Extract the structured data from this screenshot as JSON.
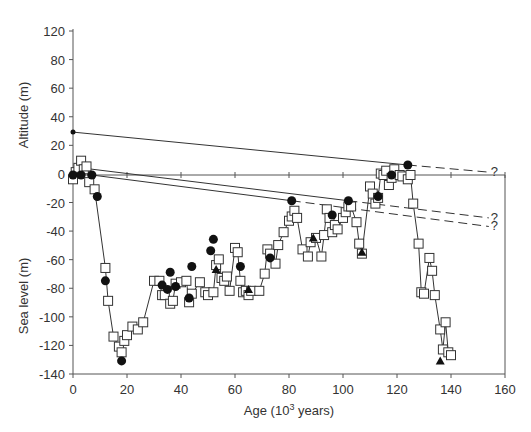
{
  "chart_data": {
    "type": "scatter",
    "title": "",
    "xlabel": "Age (10³ years)",
    "xlabel_base": "Age (10",
    "xlabel_sup": "3",
    "xlabel_tail": " years)",
    "ylabel_upper": "Altitude (m)",
    "ylabel_lower": "Sea level (m)",
    "xlim": [
      0,
      160
    ],
    "ylim": [
      -140,
      120
    ],
    "grid": false,
    "x_ticks": [
      0,
      20,
      40,
      60,
      80,
      100,
      120,
      140,
      160
    ],
    "y_ticks_upper": [
      {
        "value": 120,
        "label": "120"
      },
      {
        "value": 100,
        "label": "80"
      },
      {
        "value": 80,
        "label": "60"
      },
      {
        "value": 60,
        "label": "40"
      },
      {
        "value": 40,
        "label": "20"
      }
    ],
    "y_ticks_upper_note": "Upper axis labels printed as shown: 120, 80, 60, 40, 20, 0 at equal spacing",
    "y_ticks": [
      {
        "y": 120,
        "label": "120"
      },
      {
        "y": 100,
        "label": "80"
      },
      {
        "y": 80,
        "label": "60"
      },
      {
        "y": 60,
        "label": "40"
      },
      {
        "y": 40,
        "label": "20"
      },
      {
        "y": 20,
        "label": "0"
      },
      {
        "y": 0,
        "label": "-20"
      },
      {
        "y": -20,
        "label": "-40"
      },
      {
        "y": -40,
        "label": "-60"
      },
      {
        "y": -60,
        "label": "-80"
      },
      {
        "y": -80,
        "label": "-100"
      },
      {
        "y": -100,
        "label": "-120"
      },
      {
        "y": -120,
        "label": "-140"
      }
    ],
    "series": [
      {
        "name": "Sea-level curve (squares)",
        "marker": "open-square",
        "connected": true,
        "points": [
          [
            0,
            -3
          ],
          [
            1,
            2
          ],
          [
            2,
            5
          ],
          [
            3,
            10
          ],
          [
            4,
            4
          ],
          [
            5,
            6
          ],
          [
            6,
            -5
          ],
          [
            8,
            -10
          ],
          [
            12,
            -65
          ],
          [
            13,
            -88
          ],
          [
            15,
            -113
          ],
          [
            17,
            -120
          ],
          [
            18,
            -124
          ],
          [
            19,
            -116
          ],
          [
            20,
            -112
          ],
          [
            22,
            -106
          ],
          [
            24,
            -108
          ],
          [
            26,
            -103
          ],
          [
            30,
            -74
          ],
          [
            32,
            -74
          ],
          [
            33,
            -84
          ],
          [
            34,
            -84
          ],
          [
            36,
            -90
          ],
          [
            37,
            -88
          ],
          [
            38,
            -76
          ],
          [
            40,
            -75
          ],
          [
            42,
            -74
          ],
          [
            43,
            -89
          ],
          [
            44,
            -83
          ],
          [
            47,
            -75
          ],
          [
            49,
            -82
          ],
          [
            50,
            -84
          ],
          [
            52,
            -82
          ],
          [
            53,
            -63
          ],
          [
            54,
            -59
          ],
          [
            55,
            -72
          ],
          [
            56,
            -74
          ],
          [
            57,
            -71
          ],
          [
            58,
            -81
          ],
          [
            60,
            -51
          ],
          [
            61,
            -54
          ],
          [
            62,
            -74
          ],
          [
            63,
            -82
          ],
          [
            64,
            -81
          ],
          [
            65,
            -84
          ],
          [
            66,
            -81
          ],
          [
            69,
            -81
          ],
          [
            71,
            -69
          ],
          [
            72,
            -52
          ],
          [
            73,
            -55
          ],
          [
            75,
            -62
          ],
          [
            76,
            -49
          ],
          [
            78,
            -40
          ],
          [
            80,
            -32
          ],
          [
            81,
            -29
          ],
          [
            82,
            -25
          ],
          [
            83,
            -30
          ],
          [
            85,
            -52
          ],
          [
            87,
            -57
          ],
          [
            88,
            -47
          ],
          [
            90,
            -44
          ],
          [
            92,
            -57
          ],
          [
            93,
            -42
          ],
          [
            94,
            -24
          ],
          [
            95,
            -30
          ],
          [
            96,
            -40
          ],
          [
            97,
            -35
          ],
          [
            98,
            -38
          ],
          [
            100,
            -30
          ],
          [
            101,
            -26
          ],
          [
            102,
            -22
          ],
          [
            103,
            -22
          ],
          [
            105,
            -33
          ],
          [
            106,
            -48
          ],
          [
            107,
            -55
          ],
          [
            110,
            -8
          ],
          [
            111,
            -13
          ],
          [
            112,
            -20
          ],
          [
            113,
            -16
          ],
          [
            114,
            1
          ],
          [
            115,
            0
          ],
          [
            116,
            3
          ],
          [
            117,
            -7
          ],
          [
            118,
            -2
          ],
          [
            119,
            4
          ],
          [
            121,
            0
          ],
          [
            122,
            -1
          ],
          [
            124,
            -3
          ],
          [
            125,
            0
          ],
          [
            126,
            -20
          ],
          [
            128,
            -48
          ],
          [
            129,
            -82
          ],
          [
            130,
            -83
          ],
          [
            132,
            -58
          ],
          [
            133,
            -67
          ],
          [
            134,
            -84
          ],
          [
            136,
            -108
          ],
          [
            137,
            -122
          ],
          [
            138,
            -103
          ],
          [
            139,
            -124
          ],
          [
            140,
            -126
          ]
        ]
      },
      {
        "name": "Filled circles",
        "marker": "filled-circle",
        "connected": false,
        "points": [
          [
            0,
            0
          ],
          [
            3,
            0
          ],
          [
            7,
            0
          ],
          [
            9,
            -15
          ],
          [
            12,
            -74
          ],
          [
            18,
            -130
          ],
          [
            33,
            -77
          ],
          [
            35,
            -80
          ],
          [
            36,
            -68
          ],
          [
            38,
            -78
          ],
          [
            43,
            -86
          ],
          [
            44,
            -64
          ],
          [
            51,
            -53
          ],
          [
            52,
            -45
          ],
          [
            62,
            -64
          ],
          [
            73,
            -58
          ],
          [
            81,
            -18
          ],
          [
            96,
            -28
          ],
          [
            102,
            -18
          ],
          [
            113,
            -15
          ],
          [
            118,
            0
          ],
          [
            124,
            7
          ]
        ]
      },
      {
        "name": "Filled triangles",
        "marker": "filled-triangle",
        "connected": false,
        "points": [
          [
            53,
            -66
          ],
          [
            65,
            -80
          ],
          [
            89,
            -44
          ],
          [
            107,
            -54
          ],
          [
            113,
            -14
          ],
          [
            136,
            -130
          ]
        ]
      },
      {
        "name": "Small dot",
        "marker": "small-dot",
        "connected": false,
        "points": [
          [
            0,
            30
          ]
        ]
      }
    ],
    "correlation_lines": [
      {
        "from": [
          0,
          30
        ],
        "to": [
          124,
          7
        ],
        "style": "solid"
      },
      {
        "from": [
          124,
          7
        ],
        "to": [
          154,
          2
        ],
        "style": "dashed",
        "label": "?"
      },
      {
        "from": [
          3,
          5
        ],
        "to": [
          102,
          -18
        ],
        "style": "solid"
      },
      {
        "from": [
          102,
          -18
        ],
        "to": [
          154,
          -30
        ],
        "style": "dashed",
        "label": "?"
      },
      {
        "from": [
          7,
          0
        ],
        "to": [
          81,
          -18
        ],
        "style": "solid"
      },
      {
        "from": [
          81,
          -18
        ],
        "to": [
          154,
          -36
        ],
        "style": "dashed",
        "label": "?"
      }
    ],
    "zero_line": {
      "y": 0,
      "from_x": 0,
      "to_x": 160
    },
    "annotations": [
      "?",
      "?",
      "?"
    ]
  },
  "colors": {
    "ink": "#333333",
    "axis": "#555555",
    "marker_fill_open": "#ffffff",
    "background": "#ffffff"
  }
}
